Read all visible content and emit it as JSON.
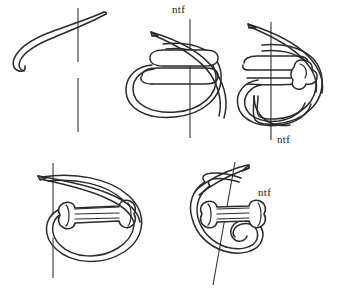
{
  "figure": {
    "background_color": "#ffffff",
    "ink_color": "#2b2b2b",
    "needle_line_color": "#333333",
    "width": 342,
    "height": 289,
    "panel_count": 5
  },
  "panels": [
    {
      "id": "panel-1",
      "position": "top-left",
      "step": "1",
      "description": "Curved thread strand crossing a broken vertical needle track",
      "label": "",
      "has_label": false,
      "has_coil": false,
      "has_loop": false
    },
    {
      "id": "panel-2",
      "position": "top-center",
      "step": "2",
      "description": "Thread formed into a flat upper loop over a large rounded loop, needle track vertical",
      "label": "ntf",
      "has_label": true,
      "label_position": "top",
      "has_coil": false,
      "has_loop": true
    },
    {
      "id": "panel-3",
      "position": "top-right",
      "step": "3",
      "description": "Loop with thread wrapped into a coil at the right side, needle track vertical",
      "label": "ntf",
      "has_label": true,
      "label_position": "bottom",
      "has_coil": true,
      "has_loop": true
    },
    {
      "id": "panel-4",
      "position": "bottom-left",
      "step": "4",
      "description": "Teardrop loop with a horizontal spool-shaped coil of wraps across the centre",
      "label": "",
      "has_label": false,
      "has_coil": true,
      "has_loop": true
    },
    {
      "id": "panel-5",
      "position": "bottom-right",
      "step": "5",
      "description": "Tightened knot with spool coil, curling free tail below, slanted needle track",
      "label": "ntf",
      "has_label": true,
      "label_position": "right",
      "has_coil": true,
      "has_loop": true
    }
  ],
  "labels": {
    "ntf_text": "ntf",
    "panel2_ntf": "ntf",
    "panel3_ntf": "ntf",
    "panel5_ntf": "ntf"
  }
}
